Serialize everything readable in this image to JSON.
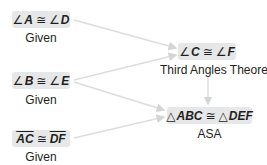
{
  "nodes": {
    "a_d": {
      "lhs_sym": "∠",
      "lhs": "A",
      "op": "≅",
      "rhs_sym": "∠",
      "rhs": "D",
      "reason": "Given"
    },
    "b_e": {
      "lhs_sym": "∠",
      "lhs": "B",
      "op": "≅",
      "rhs_sym": "∠",
      "rhs": "E",
      "reason": "Given"
    },
    "ac_df": {
      "lhs": "AC",
      "op": "≅",
      "rhs": "DF",
      "reason": "Given"
    },
    "c_f": {
      "lhs_sym": "∠",
      "lhs": "C",
      "op": "≅",
      "rhs_sym": "∠",
      "rhs": "F",
      "reason": "Third Angles Theorem"
    },
    "abc_def": {
      "lhs_sym": "△",
      "lhs": "ABC",
      "op": "≅",
      "rhs_sym": "△",
      "rhs": "DEF",
      "reason": "ASA"
    }
  },
  "colors": {
    "box_fill": "#e6e7e8",
    "arrow": "#d8d9da",
    "text": "#231f20"
  }
}
